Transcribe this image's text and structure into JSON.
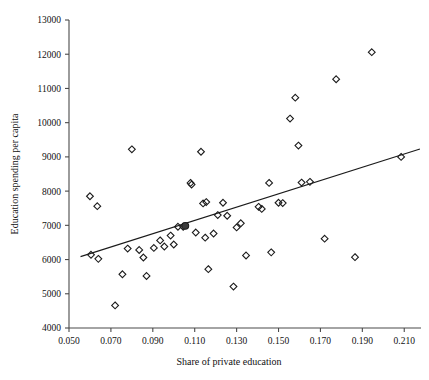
{
  "chart_data": {
    "type": "scatter",
    "title": "",
    "xlabel": "Share of private education",
    "ylabel": "Education spending per capita",
    "xlim": [
      0.05,
      0.218
    ],
    "ylim": [
      4000,
      13000
    ],
    "xticks": [
      0.05,
      0.07,
      0.09,
      0.11,
      0.13,
      0.15,
      0.17,
      0.19,
      0.21
    ],
    "xtick_labels": [
      "0.050",
      "0.070",
      "0.090",
      "0.110",
      "0.130",
      "0.150",
      "0.170",
      "0.190",
      "0.210"
    ],
    "yticks": [
      4000,
      5000,
      6000,
      7000,
      8000,
      9000,
      10000,
      11000,
      12000,
      13000
    ],
    "ytick_labels": [
      "4000",
      "5000",
      "6000",
      "7000",
      "8000",
      "9000",
      "10000",
      "11000",
      "12000",
      "13000"
    ],
    "grid": false,
    "legend": false,
    "marker_style": "open-diamond",
    "series": [
      {
        "name": "countries",
        "marker": "open-diamond",
        "points": [
          [
            0.06,
            7850
          ],
          [
            0.0635,
            7560
          ],
          [
            0.0605,
            6140
          ],
          [
            0.064,
            6020
          ],
          [
            0.072,
            4660
          ],
          [
            0.078,
            6320
          ],
          [
            0.0755,
            5570
          ],
          [
            0.08,
            9220
          ],
          [
            0.0835,
            6280
          ],
          [
            0.0855,
            6060
          ],
          [
            0.087,
            5520
          ],
          [
            0.0905,
            6340
          ],
          [
            0.0935,
            6560
          ],
          [
            0.0955,
            6380
          ],
          [
            0.0985,
            6700
          ],
          [
            0.1,
            6440
          ],
          [
            0.102,
            6960
          ],
          [
            0.1045,
            6960
          ],
          [
            0.108,
            8240
          ],
          [
            0.1085,
            8190
          ],
          [
            0.1105,
            6790
          ],
          [
            0.113,
            9150
          ],
          [
            0.114,
            7640
          ],
          [
            0.1155,
            7680
          ],
          [
            0.115,
            6640
          ],
          [
            0.1165,
            5720
          ],
          [
            0.119,
            6760
          ],
          [
            0.121,
            7300
          ],
          [
            0.1235,
            7660
          ],
          [
            0.1255,
            7280
          ],
          [
            0.1285,
            5210
          ],
          [
            0.13,
            6940
          ],
          [
            0.132,
            7060
          ],
          [
            0.1345,
            6120
          ],
          [
            0.1405,
            7540
          ],
          [
            0.142,
            7480
          ],
          [
            0.1455,
            8240
          ],
          [
            0.1465,
            6210
          ],
          [
            0.15,
            7660
          ],
          [
            0.152,
            7650
          ],
          [
            0.1555,
            10120
          ],
          [
            0.158,
            10730
          ],
          [
            0.1595,
            9330
          ],
          [
            0.161,
            8250
          ],
          [
            0.165,
            8270
          ],
          [
            0.172,
            6610
          ],
          [
            0.1775,
            11270
          ],
          [
            0.1865,
            6070
          ],
          [
            0.1945,
            12060
          ],
          [
            0.2085,
            9000
          ]
        ]
      },
      {
        "name": "highlighted-observation",
        "marker": "filled-circle",
        "points": [
          [
            0.1055,
            6985
          ]
        ]
      }
    ],
    "fit_line": {
      "name": "regression-line",
      "x_start": 0.0555,
      "y_start": 6085,
      "x_end": 0.2175,
      "y_end": 9230
    }
  }
}
